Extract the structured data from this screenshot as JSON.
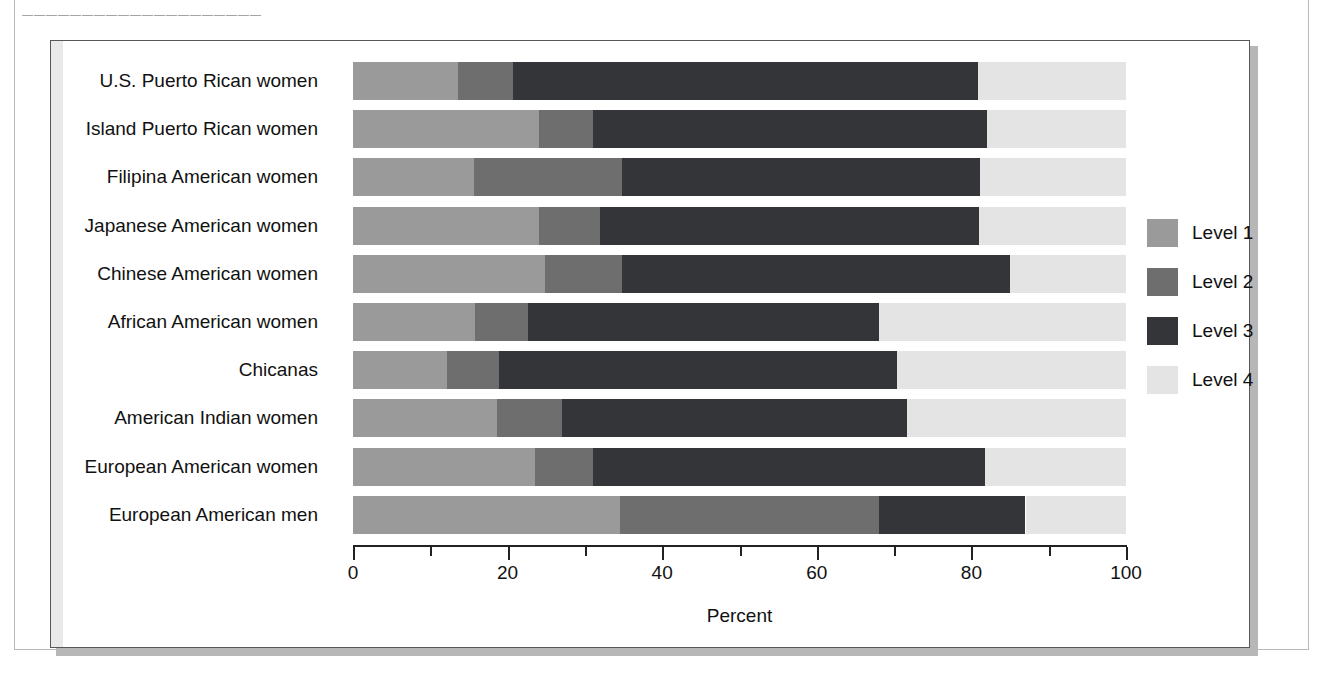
{
  "page": {
    "top_rule_text": "————————————————————"
  },
  "legend": {
    "position": "right",
    "items": [
      {
        "label": "Level 1",
        "color": "#9a9a9a"
      },
      {
        "label": "Level 2",
        "color": "#6e6e6e"
      },
      {
        "label": "Level 3",
        "color": "#333538"
      },
      {
        "label": "Level 4",
        "color": "#e4e4e4"
      }
    ]
  },
  "chart_data": {
    "type": "bar",
    "orientation": "horizontal",
    "stacked": true,
    "title": "",
    "xlabel": "Percent",
    "ylabel": "",
    "xlim": [
      0,
      100
    ],
    "grid": false,
    "legend_position": "right",
    "tick_labels": [
      "0",
      "20",
      "40",
      "60",
      "80",
      "100"
    ],
    "tick_values": [
      0,
      20,
      40,
      60,
      80,
      100
    ],
    "minor_tick_values": [
      10,
      30,
      50,
      70,
      90
    ],
    "categories": [
      "U.S. Puerto Rican women",
      "Island Puerto Rican women",
      "Filipina American women",
      "Japanese American women",
      "Chinese American women",
      "African American women",
      "Chicanas",
      "American Indian women",
      "European American women",
      "European American men"
    ],
    "series": [
      {
        "name": "Level 1",
        "color": "#9a9a9a",
        "values": [
          13.6,
          24.0,
          15.7,
          24.0,
          24.8,
          15.8,
          12.2,
          18.6,
          23.5,
          34.5
        ]
      },
      {
        "name": "Level 2",
        "color": "#6e6e6e",
        "values": [
          7.1,
          7.0,
          19.1,
          8.0,
          10.0,
          6.8,
          6.7,
          8.4,
          7.5,
          33.5
        ]
      },
      {
        "name": "Level 3",
        "color": "#333538",
        "values": [
          60.1,
          51.0,
          46.3,
          49.0,
          50.2,
          45.5,
          51.5,
          44.7,
          50.7,
          19.0
        ]
      },
      {
        "name": "Level 4",
        "color": "#e4e4e4",
        "values": [
          19.2,
          18.0,
          18.9,
          19.0,
          15.0,
          31.9,
          29.6,
          28.3,
          18.3,
          13.0
        ]
      }
    ]
  }
}
